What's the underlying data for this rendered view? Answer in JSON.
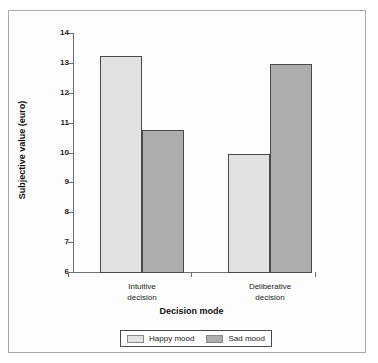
{
  "chart_data": {
    "type": "bar",
    "title": "",
    "xlabel": "Decision mode",
    "ylabel": "Subjective value (euro)",
    "categories": [
      "Intuitive decision",
      "Deliberative decision"
    ],
    "category_lines": [
      [
        "Intuitive",
        "decision"
      ],
      [
        "Deliberative",
        "decision"
      ]
    ],
    "series": [
      {
        "name": "Happy mood",
        "values": [
          13.25,
          10.0
        ],
        "color": "#e2e2e2"
      },
      {
        "name": "Sad mood",
        "values": [
          10.8,
          13.0
        ],
        "color": "#adadad"
      }
    ],
    "ylim": [
      6,
      14
    ],
    "yticks": [
      6,
      7,
      8,
      9,
      10,
      11,
      12,
      13,
      14
    ],
    "ytick_labels": [
      "6",
      "7",
      "8",
      "9",
      "10",
      "11",
      "12",
      "13",
      "14"
    ],
    "grid": false,
    "legend_position": "bottom"
  },
  "legend": {
    "items": [
      {
        "label": "Happy mood",
        "swatch": "happy-swatch"
      },
      {
        "label": "Sad mood",
        "swatch": "sad-swatch"
      }
    ]
  }
}
